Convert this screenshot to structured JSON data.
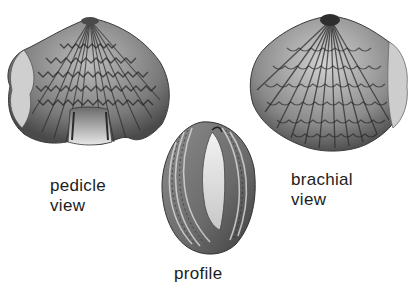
{
  "figure": {
    "specimens": [
      {
        "id": "pedicle",
        "label_lines": [
          "pedicle",
          "view"
        ]
      },
      {
        "id": "brachial",
        "label_lines": [
          "brachial",
          "view"
        ]
      },
      {
        "id": "profile",
        "label_lines": [
          "profile"
        ]
      }
    ]
  },
  "colors": {
    "background": "#ffffff",
    "ink": "#1c1c1c",
    "shell_light": "#e6e6e6",
    "shell_mid": "#9a9a9a",
    "shell_dark": "#3a3a3a"
  }
}
